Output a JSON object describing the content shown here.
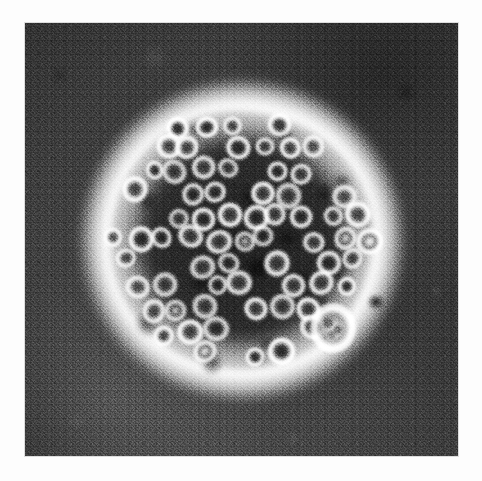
{
  "page": {
    "background_color": "#fdfdfd",
    "width": 482,
    "height": 481
  },
  "figure": {
    "kind": "electron-micrograph",
    "modality": "transmission electron microscopy, negative stain",
    "caption": "",
    "plate": {
      "x": 25,
      "y": 23,
      "width": 433,
      "height": 433,
      "background_color": "#424242",
      "halo_color": "#ffffff",
      "particle_core_color": "#3a3a3a",
      "particle_rim_color": "#fafafa"
    },
    "observations": {
      "particle_count_visible": 82,
      "particle_diameter_px": 24,
      "cluster_center_x": 241,
      "cluster_center_y": 240,
      "cluster_diameter_px": 265,
      "halo_outer_diameter_px": 330,
      "grain": "heavy photographic film grain",
      "tone": "grayscale"
    }
  },
  "chart_data": {
    "type": "heatmap",
    "title": "",
    "xlabel": "",
    "ylabel": "",
    "note": "Grayscale micrograph; no plotted axes or numeric scale present in the pixels."
  }
}
